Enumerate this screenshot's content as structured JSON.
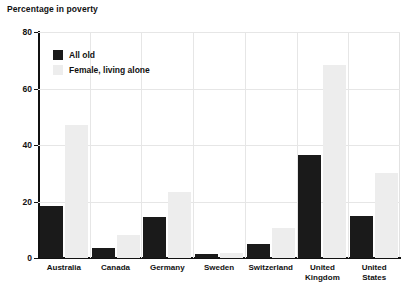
{
  "chart_data": {
    "type": "bar",
    "title": "Percentage in poverty",
    "xlabel": "",
    "ylabel": "",
    "ylim": [
      0,
      80
    ],
    "yticks": [
      0,
      20,
      40,
      60,
      80
    ],
    "grid": true,
    "legend_position": "top-left",
    "categories": [
      "Australia",
      "Canada",
      "Germany",
      "Sweden",
      "Switzerland",
      "United\nKingdom",
      "United\nStates"
    ],
    "series": [
      {
        "name": "All old",
        "color": "#1a1a1a",
        "values": [
          18.5,
          3.5,
          14.5,
          1.3,
          5.0,
          36.5,
          15.0
        ]
      },
      {
        "name": "Female, living alone",
        "color": "#ededed",
        "values": [
          47.0,
          8.0,
          23.5,
          1.8,
          10.5,
          68.5,
          30.0
        ]
      }
    ]
  },
  "legend": {
    "items": [
      {
        "label": "All old"
      },
      {
        "label": "Female, living alone"
      }
    ]
  }
}
